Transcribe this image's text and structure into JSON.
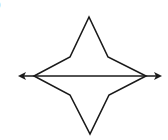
{
  "figure": {
    "corner_label": ")",
    "stroke_color": "#1a1a1a",
    "background": "#ffffff",
    "shape": {
      "type": "four-pointed-star",
      "points": [
        [
          89,
          17
        ],
        [
          108,
          57
        ],
        [
          146,
          76
        ],
        [
          109,
          95
        ],
        [
          90,
          134
        ],
        [
          70,
          95
        ],
        [
          34,
          76
        ],
        [
          70,
          57
        ]
      ]
    },
    "line": {
      "type": "double-arrow-line",
      "x1": 18,
      "y1": 76,
      "x2": 162,
      "y2": 76
    }
  }
}
